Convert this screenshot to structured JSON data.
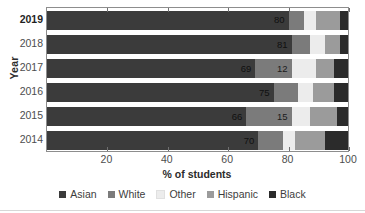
{
  "chart_data": {
    "type": "bar",
    "orientation": "horizontal",
    "stacked": true,
    "title": "",
    "xlabel": "% of students",
    "ylabel": "Year",
    "xlim": [
      0,
      100
    ],
    "xticks": [
      20,
      40,
      60,
      80,
      100
    ],
    "grid": false,
    "legend_position": "bottom",
    "categories": [
      "2019",
      "2018",
      "2017",
      "2016",
      "2015",
      "2014"
    ],
    "series": [
      {
        "name": "Asian",
        "color": "#3b3b3b",
        "values": [
          80,
          81,
          69,
          75,
          66,
          70
        ]
      },
      {
        "name": "White",
        "color": "#7b7b7b",
        "values": [
          5,
          6,
          12,
          8,
          15,
          8
        ]
      },
      {
        "name": "Other",
        "color": "#ececec",
        "values": [
          4,
          5,
          8,
          5,
          6,
          4
        ]
      },
      {
        "name": "Hispanic",
        "color": "#9b9b9b",
        "values": [
          8,
          5,
          6,
          7,
          9,
          10
        ]
      },
      {
        "name": "Black",
        "color": "#2b2b2b",
        "values": [
          3,
          3,
          5,
          5,
          4,
          8
        ]
      }
    ],
    "bar_labels": [
      {
        "year": "2019",
        "series": "Asian",
        "text": "80"
      },
      {
        "year": "2018",
        "series": "Asian",
        "text": "81"
      },
      {
        "year": "2017",
        "series": "Asian",
        "text": "69"
      },
      {
        "year": "2017",
        "series": "White",
        "text": "12"
      },
      {
        "year": "2016",
        "series": "Asian",
        "text": "75"
      },
      {
        "year": "2015",
        "series": "Asian",
        "text": "66"
      },
      {
        "year": "2015",
        "series": "White",
        "text": "15"
      },
      {
        "year": "2014",
        "series": "Asian",
        "text": "70"
      }
    ],
    "rows": [
      {
        "label": "2019",
        "emphasis": true,
        "segments": [
          {
            "name": "Asian",
            "start": 0,
            "end": 80,
            "label": "80",
            "tone": "dark"
          },
          {
            "name": "White",
            "start": 80,
            "end": 85,
            "label": "",
            "tone": "mid"
          },
          {
            "name": "Other",
            "start": 85,
            "end": 89,
            "label": "",
            "tone": "light"
          },
          {
            "name": "Hispanic",
            "start": 89,
            "end": 97,
            "label": "",
            "tone": "mid"
          },
          {
            "name": "Black",
            "start": 97,
            "end": 100,
            "label": "",
            "tone": "dark"
          }
        ]
      },
      {
        "label": "2018",
        "emphasis": false,
        "segments": [
          {
            "name": "Asian",
            "start": 0,
            "end": 81,
            "label": "81",
            "tone": "dark"
          },
          {
            "name": "White",
            "start": 81,
            "end": 87,
            "label": "",
            "tone": "mid"
          },
          {
            "name": "Other",
            "start": 87,
            "end": 92,
            "label": "",
            "tone": "light"
          },
          {
            "name": "Hispanic",
            "start": 92,
            "end": 97,
            "label": "",
            "tone": "mid"
          },
          {
            "name": "Black",
            "start": 97,
            "end": 100,
            "label": "",
            "tone": "dark"
          }
        ]
      },
      {
        "label": "2017",
        "emphasis": false,
        "segments": [
          {
            "name": "Asian",
            "start": 0,
            "end": 69,
            "label": "69",
            "tone": "dark"
          },
          {
            "name": "White",
            "start": 69,
            "end": 81,
            "label": "12",
            "tone": "mid"
          },
          {
            "name": "Other",
            "start": 81,
            "end": 89,
            "label": "",
            "tone": "light"
          },
          {
            "name": "Hispanic",
            "start": 89,
            "end": 95,
            "label": "",
            "tone": "mid"
          },
          {
            "name": "Black",
            "start": 95,
            "end": 100,
            "label": "",
            "tone": "dark"
          }
        ]
      },
      {
        "label": "2016",
        "emphasis": false,
        "segments": [
          {
            "name": "Asian",
            "start": 0,
            "end": 75,
            "label": "75",
            "tone": "dark"
          },
          {
            "name": "White",
            "start": 75,
            "end": 83,
            "label": "",
            "tone": "mid"
          },
          {
            "name": "Other",
            "start": 83,
            "end": 88,
            "label": "",
            "tone": "light"
          },
          {
            "name": "Hispanic",
            "start": 88,
            "end": 95,
            "label": "",
            "tone": "mid"
          },
          {
            "name": "Black",
            "start": 95,
            "end": 100,
            "label": "",
            "tone": "dark"
          }
        ]
      },
      {
        "label": "2015",
        "emphasis": false,
        "segments": [
          {
            "name": "Asian",
            "start": 0,
            "end": 66,
            "label": "66",
            "tone": "dark"
          },
          {
            "name": "White",
            "start": 66,
            "end": 81,
            "label": "15",
            "tone": "mid"
          },
          {
            "name": "Other",
            "start": 81,
            "end": 87,
            "label": "",
            "tone": "light"
          },
          {
            "name": "Hispanic",
            "start": 87,
            "end": 96,
            "label": "",
            "tone": "mid"
          },
          {
            "name": "Black",
            "start": 96,
            "end": 100,
            "label": "",
            "tone": "dark"
          }
        ]
      },
      {
        "label": "2014",
        "emphasis": false,
        "segments": [
          {
            "name": "Asian",
            "start": 0,
            "end": 70,
            "label": "70",
            "tone": "dark"
          },
          {
            "name": "White",
            "start": 70,
            "end": 78,
            "label": "",
            "tone": "mid"
          },
          {
            "name": "Other",
            "start": 78,
            "end": 82,
            "label": "",
            "tone": "light"
          },
          {
            "name": "Hispanic",
            "start": 82,
            "end": 92,
            "label": "",
            "tone": "mid"
          },
          {
            "name": "Black",
            "start": 92,
            "end": 100,
            "label": "",
            "tone": "dark"
          }
        ]
      }
    ]
  },
  "legend": {
    "items": [
      {
        "label": "Asian",
        "color": "#3b3b3b"
      },
      {
        "label": "White",
        "color": "#7b7b7b"
      },
      {
        "label": "Other",
        "color": "#ececec"
      },
      {
        "label": "Hispanic",
        "color": "#9b9b9b"
      },
      {
        "label": "Black",
        "color": "#2b2b2b"
      }
    ]
  },
  "axes": {
    "y_title": "Year",
    "x_title": "% of students",
    "x_ticks": [
      "20",
      "40",
      "60",
      "80",
      "100"
    ],
    "y_ticks": [
      "2019",
      "2018",
      "2017",
      "2016",
      "2015",
      "2014"
    ]
  }
}
